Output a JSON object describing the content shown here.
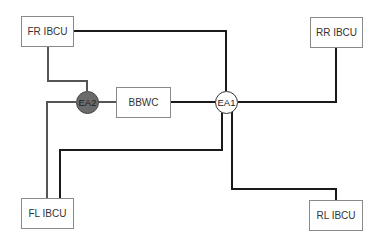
{
  "diagram": {
    "boxes": {
      "fr": "FR IBCU",
      "rr": "RR IBCU",
      "fl": "FL IBCU",
      "rl": "RL IBCU",
      "bbwc": "BBWC"
    },
    "nodes": {
      "ea1": "EA1",
      "ea2": "EA2"
    },
    "colors": {
      "line_dark": "#1a1a1a",
      "line_gray": "#555555",
      "ea2_fill": "#6b6b6b",
      "ea1_fill": "#ffffff",
      "box_border": "#8a8a8a"
    },
    "connections": [
      {
        "from": "FR IBCU",
        "to": "EA1"
      },
      {
        "from": "FR IBCU",
        "to": "EA2"
      },
      {
        "from": "EA2",
        "to": "BBWC"
      },
      {
        "from": "BBWC",
        "to": "EA1"
      },
      {
        "from": "EA1",
        "to": "RR IBCU"
      },
      {
        "from": "EA2",
        "to": "FL IBCU"
      },
      {
        "from": "EA1",
        "to": "FL IBCU"
      },
      {
        "from": "EA1",
        "to": "RL IBCU"
      }
    ]
  }
}
